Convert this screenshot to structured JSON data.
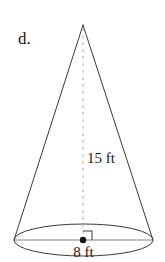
{
  "figure": {
    "type": "cone",
    "part_label": "d.",
    "background_color": "#ffffff",
    "outline_color": "#3a3a3a",
    "dashed_color": "#b0b0b0",
    "diameter_line_color": "#808080",
    "text_color": "#1a1a1a",
    "height_label": "15 ft",
    "diameter_label": "8 ft",
    "height_value": 15,
    "diameter_value": 8,
    "units": "ft",
    "right_angle_marker": "right-angle",
    "center_point": "center-dot"
  },
  "geometry": {
    "apex": {
      "x": 83,
      "y": 25
    },
    "base_center": {
      "x": 83.5,
      "y": 240
    },
    "base_rx": 69.5,
    "base_ry": 16,
    "base_left": {
      "x": 14,
      "y": 240
    },
    "base_right": {
      "x": 153,
      "y": 240
    },
    "right_angle_size": 9
  },
  "labels": {
    "part": {
      "x": 18,
      "y": 44
    },
    "height": {
      "x": 87,
      "y": 163
    },
    "diameter": {
      "x": 83.5,
      "y": 257
    }
  }
}
